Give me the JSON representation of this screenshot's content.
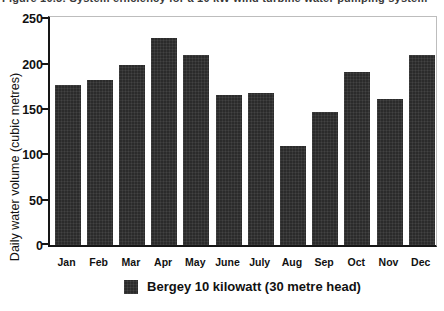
{
  "figure": {
    "caption_clipped": "Figure 10.5: System efficiency for a 10 kW wind turbine water pumping system",
    "legend_label": "Bergey 10 kilowatt (30 metre head)"
  },
  "chart_data": {
    "type": "bar",
    "categories": [
      "Jan",
      "Feb",
      "Mar",
      "Apr",
      "May",
      "June",
      "July",
      "Aug",
      "Sep",
      "Oct",
      "Nov",
      "Dec"
    ],
    "values": [
      176,
      182,
      198,
      228,
      209,
      165,
      168,
      109,
      147,
      191,
      161,
      209
    ],
    "title": "Figure 10.5: System efficiency for a 10 kW wind turbine water pumping system",
    "xlabel": "",
    "ylabel": "Daily water volume (cubic metres)",
    "ylim": [
      0,
      250
    ],
    "yticks": [
      0,
      50,
      100,
      150,
      200,
      250
    ],
    "legend": [
      "Bergey 10 kilowatt (30 metre head)"
    ],
    "legend_position": "bottom",
    "grid": false,
    "bar_color": "#2b2b2b",
    "background_color": "#ffffff"
  }
}
